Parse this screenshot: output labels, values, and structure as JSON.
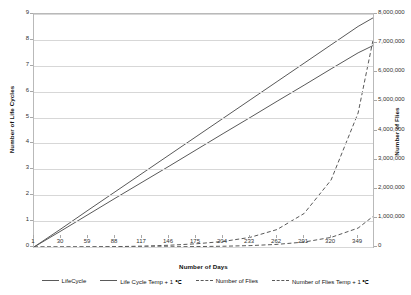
{
  "chart_data": {
    "type": "line",
    "title": "",
    "xlabel": "Number of Days",
    "ylabel": "Number of Life Cycles",
    "y2label": "Number of Flies",
    "grid": true,
    "legend_position": "bottom",
    "xlim": [
      1,
      365
    ],
    "ylim": [
      0,
      9
    ],
    "y2lim": [
      0,
      8000000
    ],
    "xticks": [
      1,
      30,
      59,
      88,
      117,
      146,
      175,
      204,
      233,
      262,
      291,
      320,
      349
    ],
    "xtick_labels": [
      "1",
      "30",
      "59",
      "88",
      "117",
      "146",
      "175",
      "204",
      "233",
      "262",
      "291",
      "320",
      "349"
    ],
    "yticks": [
      0,
      1,
      2,
      3,
      4,
      5,
      6,
      7,
      8,
      9
    ],
    "ytick_labels": [
      "0",
      "1",
      "2",
      "3",
      "4",
      "5",
      "6",
      "7",
      "8",
      "9"
    ],
    "y2ticks": [
      0,
      1000000,
      2000000,
      3000000,
      4000000,
      5000000,
      6000000,
      7000000,
      8000000
    ],
    "y2tick_labels": [
      "0",
      "1,000,000",
      "2,000,000",
      "3,000,000",
      "4,000,000",
      "5,000,000",
      "6,000,000",
      "7,000,000",
      "8,000,000"
    ],
    "x": [
      1,
      30,
      59,
      88,
      117,
      146,
      175,
      204,
      233,
      262,
      291,
      320,
      349,
      365
    ],
    "series": [
      {
        "name": "LifeCycle",
        "axis": "left",
        "style": "solid",
        "color": "#595959",
        "values": [
          0,
          0.62,
          1.25,
          1.88,
          2.5,
          3.12,
          3.75,
          4.38,
          5.0,
          5.63,
          6.25,
          6.88,
          7.5,
          7.78
        ]
      },
      {
        "name": "Life Cycle Temp + 1 ℃",
        "axis": "left",
        "style": "solid",
        "color": "#595959",
        "values": [
          0,
          0.7,
          1.42,
          2.13,
          2.84,
          3.55,
          4.26,
          4.97,
          5.68,
          6.39,
          7.1,
          7.81,
          8.52,
          8.85
        ]
      },
      {
        "name": "Number of Flies",
        "axis": "right",
        "style": "dashed",
        "color": "#595959",
        "values": [
          0,
          1000,
          4000,
          12000,
          30000,
          60000,
          110000,
          190000,
          330000,
          600000,
          1150000,
          2300000,
          4600000,
          7100000
        ]
      },
      {
        "name": "Number of Flies Temp + 1 ℃",
        "axis": "right",
        "style": "dashed",
        "color": "#595959",
        "values": [
          0,
          0,
          500,
          1500,
          3500,
          7000,
          14000,
          26000,
          48000,
          90000,
          170000,
          330000,
          650000,
          1050000
        ]
      }
    ]
  },
  "legend": {
    "items": [
      {
        "label": "LifeCycle",
        "style": "solid"
      },
      {
        "label": "Life Cycle Temp + 1 ℃",
        "style": "solid"
      },
      {
        "label": "Number of Flies",
        "style": "dashed"
      },
      {
        "label": "Number of Flies Temp + 1 ℃",
        "style": "dashed"
      }
    ]
  }
}
